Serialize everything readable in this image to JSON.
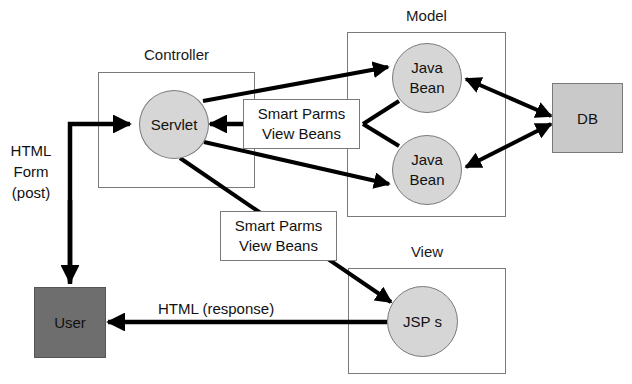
{
  "diagram": {
    "groups": {
      "controller": {
        "label": "Controller"
      },
      "model": {
        "label": "Model"
      },
      "view": {
        "label": "View"
      }
    },
    "nodes": {
      "servlet": {
        "label": "Servlet"
      },
      "java_bean_1": {
        "line1": "Java",
        "line2": "Bean"
      },
      "java_bean_2": {
        "line1": "Java",
        "line2": "Bean"
      },
      "jsps": {
        "label": "JSP s"
      },
      "db": {
        "label": "DB"
      },
      "user": {
        "label": "User"
      }
    },
    "edge_labels": {
      "to_servlet": {
        "line1": "Smart Parms",
        "line2": "View Beans"
      },
      "to_jsp": {
        "line1": "Smart Parms",
        "line2": "View Beans"
      },
      "html_form": {
        "line1": "HTML",
        "line2": "Form",
        "line3": "(post)"
      },
      "html_response": "HTML (response)"
    },
    "colors": {
      "circle_fill": "#d6d6d6",
      "db_fill": "#c9c9c9",
      "user_fill": "#6e6e6e",
      "border": "#7a7a7a",
      "arrow": "#000000"
    },
    "edges": [
      {
        "from": "User",
        "to": "Servlet",
        "label": "HTML Form (post)"
      },
      {
        "from": "Servlet",
        "to": "Java Bean (top)"
      },
      {
        "from": "Servlet",
        "to": "Java Bean (bottom)"
      },
      {
        "from": "Java Beans",
        "to": "Servlet",
        "label": "Smart Parms / View Beans"
      },
      {
        "from": "Java Bean (top)",
        "to": "DB",
        "bidirectional": true
      },
      {
        "from": "Java Bean (bottom)",
        "to": "DB",
        "bidirectional": true
      },
      {
        "from": "Servlet",
        "to": "JSP s",
        "label": "Smart Parms / View Beans"
      },
      {
        "from": "JSP s",
        "to": "User",
        "label": "HTML (response)"
      }
    ]
  }
}
